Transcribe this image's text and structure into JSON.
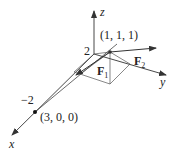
{
  "diagram": {
    "type": "3d-vector-diagram",
    "axes": {
      "x": {
        "label": "x"
      },
      "y": {
        "label": "y"
      },
      "z": {
        "label": "z"
      }
    },
    "tick_labels": {
      "z_tick": "2",
      "x_tick": "−2"
    },
    "points": [
      {
        "name": "point-1-1-1",
        "label": "(1, 1, 1)"
      },
      {
        "name": "point-3-0-0",
        "label": "(3, 0, 0)"
      }
    ],
    "vectors": [
      {
        "name": "F1",
        "label_main": "F",
        "label_sub": "1"
      },
      {
        "name": "F2",
        "label_main": "F",
        "label_sub": "2"
      }
    ],
    "colors": {
      "line": "#333333",
      "background": "#ffffff"
    }
  }
}
